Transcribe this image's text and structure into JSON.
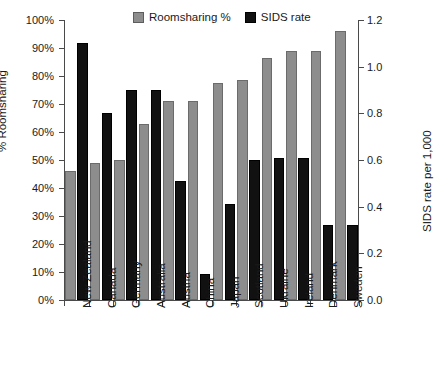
{
  "chart_data": {
    "type": "bar",
    "title": "",
    "xlabel": "",
    "ylabel": "% Roomsharing",
    "y2label": "SIDS rate per 1,000",
    "ylim": [
      0,
      100
    ],
    "y2lim": [
      0,
      1.2
    ],
    "yticks": [
      "0%",
      "10%",
      "20%",
      "30%",
      "40%",
      "50%",
      "60%",
      "70%",
      "80%",
      "90%",
      "100%"
    ],
    "y2ticks": [
      "0.0",
      "0.2",
      "0.4",
      "0.6",
      "0.8",
      "1.0",
      "1.2"
    ],
    "grid": false,
    "legend_position": "top-center",
    "categories": [
      "New Zealand",
      "Canada",
      "Germany",
      "Australia",
      "Austria",
      "China",
      "Japan",
      "Scotland",
      "Ukraine",
      "Ireland",
      "Denmark",
      "Sweden"
    ],
    "series": [
      {
        "name": "Roomsharing %",
        "color": "#8d8d8d",
        "axis": "left",
        "unit": "%",
        "values": [
          46,
          49,
          50,
          63,
          71,
          71,
          77.5,
          78.5,
          86.5,
          89,
          89,
          96
        ]
      },
      {
        "name": "SIDS rate",
        "color": "#111111",
        "axis": "right",
        "unit": "per 1,000",
        "values": [
          1.1,
          0.8,
          0.9,
          0.9,
          0.51,
          0.11,
          0.41,
          0.6,
          0.61,
          0.61,
          0.32,
          0.32
        ]
      }
    ]
  },
  "legend": {
    "entries": [
      {
        "label": "Roomsharing %",
        "color": "#8d8d8d"
      },
      {
        "label": "SIDS rate",
        "color": "#111111"
      }
    ]
  }
}
